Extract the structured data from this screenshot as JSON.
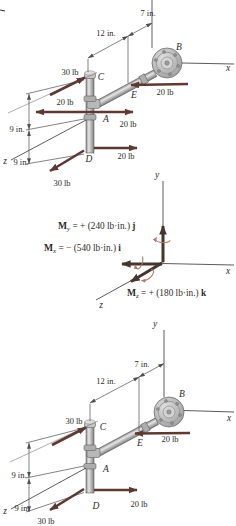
{
  "colors": {
    "force_arrow": "#5d3a31",
    "moment_arrow": "#46342e",
    "rotation_arrow": "#b5786a",
    "line": "#4f4f4f",
    "text": "#2e2a28",
    "pipe_light": "#e6e6e6",
    "pipe_dark": "#7f7f7f"
  },
  "figure_top": {
    "dim_7": "7 in.",
    "dim_12": "12 in.",
    "dim_9_upper": "9 in.",
    "dim_9_lower": "9 in.",
    "force_30_c": "30 lb",
    "force_20_e": "20 lb",
    "force_20_a_left": "20 lb",
    "force_20_a_right": "20 lb",
    "force_20_d": "20 lb",
    "force_30_d": "30 lb",
    "point_a": "A",
    "point_b": "B",
    "point_c": "C",
    "point_d": "D",
    "point_e": "E",
    "axis_x": "x",
    "axis_z": "z"
  },
  "figure_middle": {
    "axis_x": "x",
    "axis_y": "y",
    "axis_z": "z",
    "moment_y": {
      "symbol": "M",
      "subscript": "y",
      "value": " = + (240 lb·in.) ",
      "unit_vector": "j"
    },
    "moment_x": {
      "symbol": "M",
      "subscript": "x",
      "value": " = − (540 lb·in.) ",
      "unit_vector": "i"
    },
    "moment_z": {
      "symbol": "M",
      "subscript": "z",
      "value": " = + (180 lb·in.) ",
      "unit_vector": "k"
    }
  },
  "figure_bottom": {
    "dim_7": "7 in.",
    "dim_12": "12 in.",
    "dim_9_upper": "9 in.",
    "dim_9_lower": "9 in.",
    "force_30_c": "30 lb",
    "force_20_e": "20 lb",
    "force_20_d": "20 lb",
    "force_30_d": "30 lb",
    "point_a": "A",
    "point_b": "B",
    "point_c": "C",
    "point_d": "D",
    "point_e": "E",
    "axis_x": "x",
    "axis_y": "y",
    "axis_z": "z"
  }
}
